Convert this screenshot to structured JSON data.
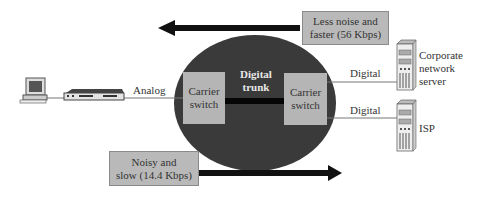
{
  "diagram": {
    "nodes": {
      "pc": {
        "icon": "computer-icon"
      },
      "modem": {
        "icon": "modem-icon"
      },
      "carrier_network": {
        "shape": "ellipse",
        "color": "#3a3a3a"
      },
      "left_switch": {
        "label_line1": "Carrier",
        "label_line2": "switch"
      },
      "right_switch": {
        "label_line1": "Carrier",
        "label_line2": "switch"
      },
      "trunk": {
        "label_line1": "Digital",
        "label_line2": "trunk"
      },
      "corporate_server": {
        "icon": "server-icon",
        "label_line1": "Corporate",
        "label_line2": "network",
        "label_line3": "server"
      },
      "isp_server": {
        "icon": "server-icon",
        "label": "ISP"
      }
    },
    "links": {
      "analog": "Analog",
      "digital_top": "Digital",
      "digital_bottom": "Digital"
    },
    "callouts": {
      "top": {
        "line1": "Less noise and",
        "line2": "faster (56 Kbps)",
        "arrow_direction": "left"
      },
      "bottom": {
        "line1": "Noisy and",
        "line2": "slow (14.4 Kbps)",
        "arrow_direction": "right"
      }
    },
    "colors": {
      "ellipse": "#3a3a3a",
      "switch_fill": "#b5b5b5",
      "callout_fill": "#b9b9b9",
      "arrow": "#111111",
      "line": "#777777"
    }
  }
}
